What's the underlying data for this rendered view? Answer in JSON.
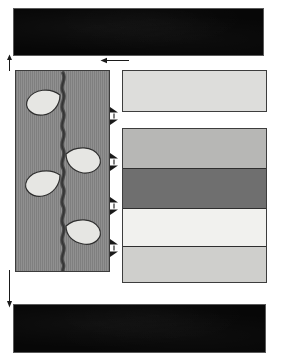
{
  "figure": {
    "canvas": {
      "width": 285,
      "height": 363,
      "background": "#ffffff"
    }
  },
  "plates": [
    {
      "id": "plate-top",
      "name": "top-photo-plate",
      "label": "",
      "x": 14,
      "y": 9,
      "width": 249,
      "height": 46,
      "color": "#070707"
    },
    {
      "id": "plate-bottom",
      "name": "bottom-photo-plate",
      "label": "",
      "x": 14,
      "y": 305,
      "width": 251,
      "height": 47,
      "color": "#070707"
    }
  ],
  "specimen_panel": {
    "name": "plant-specimen-panel",
    "x": 15,
    "y": 70,
    "width": 95,
    "height": 202,
    "fill": "#8a8a8a",
    "stroke": "#3c3c3c",
    "stem": {
      "name": "plant-stem",
      "color": "#4a4a4a",
      "style": "wavy-vertical"
    },
    "leaves": [
      {
        "name": "leaf-1",
        "side": "left",
        "cx": 25,
        "cy": 32,
        "fill": "#e6e6e3"
      },
      {
        "name": "leaf-2",
        "side": "right",
        "cx": 62,
        "cy": 90,
        "fill": "#e6e6e3"
      },
      {
        "name": "leaf-3",
        "side": "left",
        "cx": 24,
        "cy": 112,
        "fill": "#e6e6e3"
      },
      {
        "name": "leaf-4",
        "side": "right",
        "cx": 62,
        "cy": 162,
        "fill": "#e6e6e3"
      }
    ]
  },
  "columns": [
    {
      "id": "column-upper",
      "name": "upper-lithology-column",
      "x": 122,
      "y": 70,
      "width": 145,
      "height": 42,
      "stroke": "#3d3d3d",
      "bands": [
        {
          "name": "band-upper-1",
          "top": 0,
          "height": 42,
          "color": "#dddddb",
          "label": ""
        }
      ]
    },
    {
      "id": "column-lower",
      "name": "lower-lithology-column",
      "x": 122,
      "y": 128,
      "width": 145,
      "height": 155,
      "stroke": "#3d3d3d",
      "bands": [
        {
          "name": "band-lower-1",
          "top": 0,
          "height": 40,
          "color": "#b7b7b5",
          "label": ""
        },
        {
          "name": "band-lower-2",
          "top": 40,
          "height": 40,
          "color": "#6f6f6f",
          "label": ""
        },
        {
          "name": "band-lower-3",
          "top": 80,
          "height": 38,
          "color": "#f1f1ee",
          "label": ""
        },
        {
          "name": "band-lower-4",
          "top": 118,
          "height": 37,
          "color": "#cfcfcc",
          "label": ""
        }
      ]
    }
  ],
  "leaders": [
    {
      "name": "top-correlation-leader",
      "x": 100,
      "y": 57,
      "width": 28,
      "height": 7,
      "direction": "left",
      "color": "#1a1a1a"
    },
    {
      "name": "left-top-tick-leader",
      "x": 5,
      "y": 54,
      "width": 8,
      "height": 16,
      "direction": "up",
      "color": "#1a1a1a"
    },
    {
      "name": "left-bottom-extent-leader",
      "x": 5,
      "y": 270,
      "width": 8,
      "height": 36,
      "direction": "down",
      "color": "#1a1a1a"
    }
  ],
  "tiepoints": [
    {
      "name": "tiepoint-1",
      "x": 108,
      "y": 106,
      "label": ""
    },
    {
      "name": "tiepoint-2",
      "x": 108,
      "y": 152,
      "label": ""
    },
    {
      "name": "tiepoint-3",
      "x": 108,
      "y": 196,
      "label": ""
    },
    {
      "name": "tiepoint-4",
      "x": 108,
      "y": 238,
      "label": ""
    }
  ]
}
